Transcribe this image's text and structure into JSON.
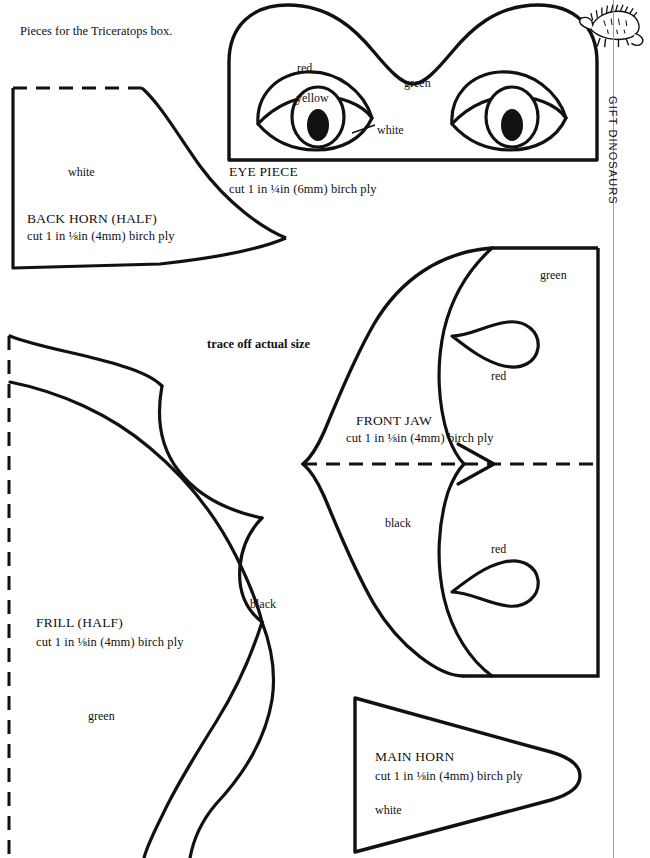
{
  "page": {
    "intro_note": "Pieces for the Triceratops box.",
    "trace_note": "trace off actual size",
    "side_label": "GIFT DINOSAURS",
    "logo_icon": "dinosaur-icon",
    "ink_color": "#111111",
    "paper_color": "#ffffff",
    "rule_color": "#9a9a9a"
  },
  "pieces": [
    {
      "id": "back-horn",
      "title": "BACK HORN (HALF)",
      "spec": "cut 1 in ⅛in (4mm) birch ply",
      "colour_labels": [
        "white"
      ]
    },
    {
      "id": "eye-piece",
      "title": "EYE PIECE",
      "spec": "cut 1 in ¼in (6mm) birch ply",
      "colour_labels": [
        "red",
        "yellow",
        "white",
        "green"
      ]
    },
    {
      "id": "front-jaw",
      "title": "FRONT JAW",
      "spec": "cut 1 in ⅛in (4mm) birch ply",
      "colour_labels": [
        "green",
        "red",
        "black",
        "red"
      ]
    },
    {
      "id": "frill-half",
      "title": "FRILL (HALF)",
      "spec": "cut 1 in ⅛in (4mm) birch ply",
      "colour_labels": [
        "black",
        "green"
      ]
    },
    {
      "id": "main-horn",
      "title": "MAIN HORN",
      "spec": "cut 1 in ⅛in (4mm) birch ply",
      "colour_labels": [
        "white"
      ]
    }
  ],
  "labels": {
    "back_horn_title": "BACK HORN (HALF)",
    "back_horn_spec": "cut 1 in ⅛in (4mm) birch ply",
    "back_horn_white": "white",
    "eye_title": "EYE PIECE",
    "eye_spec": "cut 1 in ¼in (6mm) birch ply",
    "eye_red": "red",
    "eye_yellow": "yellow",
    "eye_white": "white",
    "eye_green": "green",
    "jaw_title": "FRONT JAW",
    "jaw_spec": "cut 1 in ⅛in (4mm) birch ply",
    "jaw_green": "green",
    "jaw_red_top": "red",
    "jaw_black": "black",
    "jaw_red_bottom": "red",
    "frill_title": "FRILL (HALF)",
    "frill_spec": "cut 1 in ⅛in (4mm) birch ply",
    "frill_black": "black",
    "frill_green": "green",
    "horn_title": "MAIN HORN",
    "horn_spec": "cut 1 in ⅛in (4mm) birch ply",
    "horn_white": "white"
  }
}
